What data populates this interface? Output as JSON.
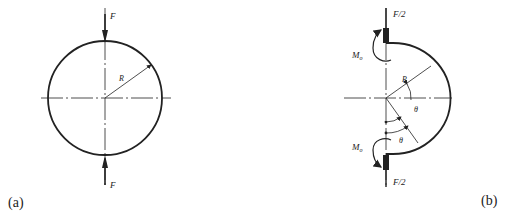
{
  "figure": {
    "panel_a": {
      "caption": "(a)",
      "force_top_label": "F",
      "force_bottom_label": "F",
      "radius_label": "R"
    },
    "panel_b": {
      "caption": "(b)",
      "force_top_label": "F/2",
      "force_bottom_label": "F/2",
      "moment_top_label": "M",
      "moment_top_sub": "o",
      "moment_bottom_label": "M",
      "moment_bottom_sub": "o",
      "radius_label": "R",
      "angle_label_1": "θ",
      "angle_label_2": "θ"
    },
    "colors": {
      "stroke": "#222222",
      "background": "#ffffff"
    }
  }
}
